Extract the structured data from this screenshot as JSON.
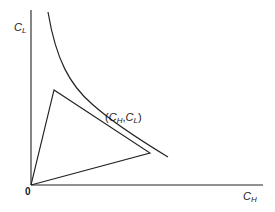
{
  "diagram": {
    "axes": {
      "y_label": {
        "main": "C",
        "sub": "L"
      },
      "x_label": {
        "main": "C",
        "sub": "H"
      },
      "origin_label": "0"
    },
    "point_label": {
      "open": "(",
      "c1_main": "C",
      "c1_sub": "H",
      "comma": ",",
      "c2_main": "C",
      "c2_sub": "L",
      "close": ")"
    },
    "elements": [
      "vertical axis C_L",
      "horizontal axis C_H",
      "convex decreasing curve (indifference/isoquant-like)",
      "triangle with vertex at origin, tangent to curve at (C_H, C_L)"
    ],
    "colors": {
      "stroke": "#222222",
      "text": "#1a1a1a",
      "background": "#ffffff"
    }
  }
}
